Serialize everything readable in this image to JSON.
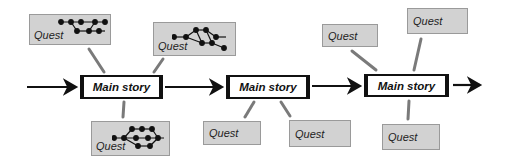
{
  "diagram": {
    "type": "story-structure",
    "main_nodes": [
      {
        "id": "main-1",
        "label": "Main story"
      },
      {
        "id": "main-2",
        "label": "Main story"
      },
      {
        "id": "main-3",
        "label": "Main story"
      }
    ],
    "quest_nodes": [
      {
        "id": "quest-1",
        "label": "Quest",
        "attached_to": "main-1",
        "position": "top-left",
        "has_graph": true
      },
      {
        "id": "quest-2",
        "label": "Quest",
        "attached_to": "main-1",
        "position": "top-right",
        "has_graph": true
      },
      {
        "id": "quest-3",
        "label": "Quest",
        "attached_to": "main-1",
        "position": "bottom",
        "has_graph": true
      },
      {
        "id": "quest-4",
        "label": "Quest",
        "attached_to": "main-2",
        "position": "bottom-left",
        "has_graph": false
      },
      {
        "id": "quest-5",
        "label": "Quest",
        "attached_to": "main-2",
        "position": "bottom-right",
        "has_graph": false
      },
      {
        "id": "quest-6",
        "label": "Quest",
        "attached_to": "main-3",
        "position": "top-left",
        "has_graph": false
      },
      {
        "id": "quest-7",
        "label": "Quest",
        "attached_to": "main-3",
        "position": "top-right",
        "has_graph": false
      },
      {
        "id": "quest-8",
        "label": "Quest",
        "attached_to": "main-3",
        "position": "bottom",
        "has_graph": false
      }
    ],
    "flow_arrows": [
      "entry -> main-1",
      "main-1 -> main-2",
      "main-2 -> main-3",
      "main-3 -> exit"
    ],
    "colors": {
      "quest_fill": "#d2d2d2",
      "quest_border": "#9a9a9a",
      "connector": "#777777",
      "arrow": "#111111"
    }
  }
}
